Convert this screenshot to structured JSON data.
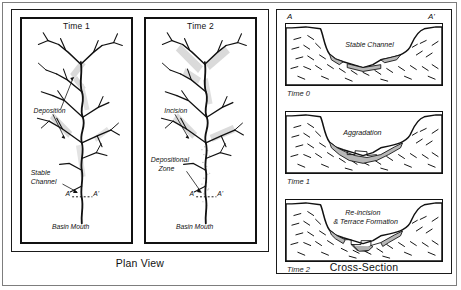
{
  "figure": {
    "plan_view_caption": "Plan View",
    "cross_section_caption": "Cross-Section"
  },
  "plan_panels": [
    {
      "title": "Time 1",
      "annotations": [
        {
          "label": "Deposition"
        },
        {
          "label": "Stable",
          "label2": "Channel"
        },
        {
          "label": "Basin Mouth"
        }
      ],
      "section_marks": {
        "left": "A",
        "right": "A'"
      }
    },
    {
      "title": "Time 2",
      "annotations": [
        {
          "label": "Incision"
        },
        {
          "label": "Depositional",
          "label2": "Zone"
        },
        {
          "label": "Basin Mouth"
        }
      ],
      "section_marks": {
        "left": "A",
        "right": "A'"
      }
    }
  ],
  "cross_sections": {
    "end_labels": {
      "left": "A",
      "right": "A'"
    },
    "panels": [
      {
        "time_label": "Time 0",
        "feature_label": "Stable Channel",
        "feature_label2": ""
      },
      {
        "time_label": "Time 1",
        "feature_label": "Aggradation",
        "feature_label2": ""
      },
      {
        "time_label": "Time 2",
        "feature_label": "Re-incision",
        "feature_label2": "& Terrace Formation"
      }
    ]
  },
  "colors": {
    "line": "#111111",
    "alluvium_gray": "#b9b9b9",
    "shade_gray": "#c9c9c9",
    "background": "#ffffff",
    "frame": "#7d7d7d"
  }
}
